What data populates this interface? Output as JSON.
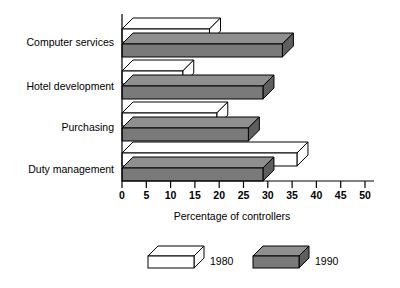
{
  "chart_data": {
    "type": "bar",
    "orientation": "horizontal",
    "title": "",
    "xlabel": "Percentage of controllers",
    "ylabel": "",
    "xlim": [
      0,
      50
    ],
    "xticks": [
      0,
      5,
      10,
      15,
      20,
      25,
      30,
      35,
      40,
      45,
      50
    ],
    "xtick_labels": [
      "0",
      "5",
      "10",
      "15",
      "20",
      "25",
      "30",
      "35",
      "40",
      "45",
      "50"
    ],
    "grid": false,
    "legend_position": "bottom",
    "categories": [
      "Computer services",
      "Hotel development",
      "Purchasing",
      "Duty management"
    ],
    "series": [
      {
        "name": "1980",
        "color": "#ffffff",
        "values": [
          18,
          12.5,
          19.5,
          36
        ]
      },
      {
        "name": "1990",
        "color": "#7a7a7a",
        "values": [
          33,
          29,
          26,
          29
        ]
      }
    ]
  },
  "axis": {
    "title": "Percentage of controllers"
  },
  "legend": {
    "entries": [
      {
        "label": "1980",
        "swatch": "white-3d-box"
      },
      {
        "label": "1990",
        "swatch": "gray-3d-box"
      }
    ]
  },
  "colors": {
    "bar_1980": "#ffffff",
    "bar_1990": "#7a7a7a",
    "bar_1990_top": "#8f8f8f",
    "bar_1990_side": "#5e5e5e",
    "outline": "#000000",
    "background": "#ffffff"
  }
}
